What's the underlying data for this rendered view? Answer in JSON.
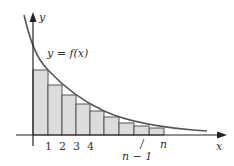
{
  "diagram": {
    "title": "",
    "curve_label": "y = f(x)",
    "axes": {
      "x_label": "x",
      "y_label": "y"
    },
    "tick_labels": [
      "1",
      "2",
      "3",
      "4",
      "n − 1",
      "n"
    ],
    "rectangles": {
      "count": 8,
      "description": "Inscribed (right-endpoint) rectangles under a decreasing curve y = f(x)",
      "fill_color": "#dcdcdc",
      "stroke_color": "#444444"
    },
    "curve_color": "#555555",
    "axis_color": "#222222"
  }
}
